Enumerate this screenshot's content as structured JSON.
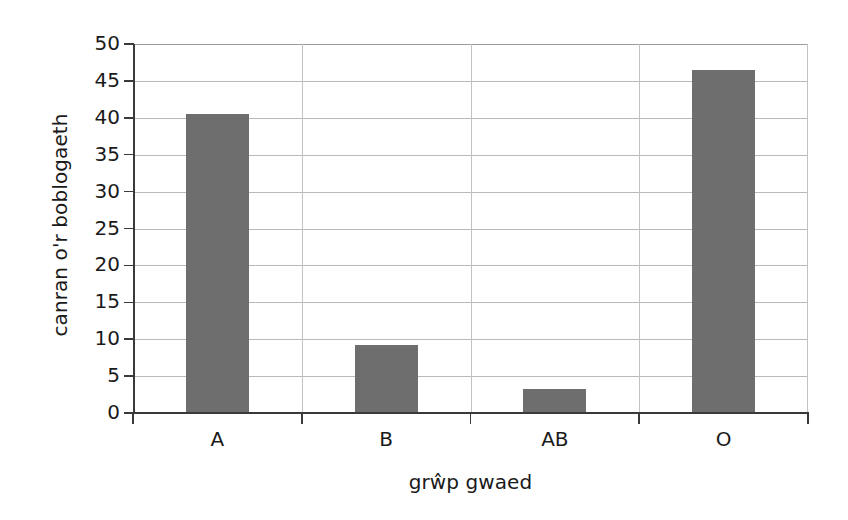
{
  "chart_data": {
    "type": "bar",
    "title": "",
    "subtitle": "",
    "categories": [
      "A",
      "B",
      "AB",
      "O"
    ],
    "values": [
      40.5,
      9.2,
      3.2,
      46.5
    ],
    "xlabel": "grŵp gwaed",
    "ylabel": "canran o'r boblogaeth",
    "ylim": [
      0,
      50
    ],
    "ytick_labels": [
      "0",
      "5",
      "10",
      "15",
      "20",
      "25",
      "30",
      "35",
      "40",
      "45",
      "50"
    ],
    "ytick_values": [
      0,
      5,
      10,
      15,
      20,
      25,
      30,
      35,
      40,
      45,
      50
    ],
    "grid": "horizontal-and-vertical-category-boundaries",
    "legend": "none",
    "bar_color": "#6e6e6e",
    "axis_color": "#3a3a3a",
    "grid_color": "#b9b9b9",
    "background_color": "#ffffff"
  }
}
